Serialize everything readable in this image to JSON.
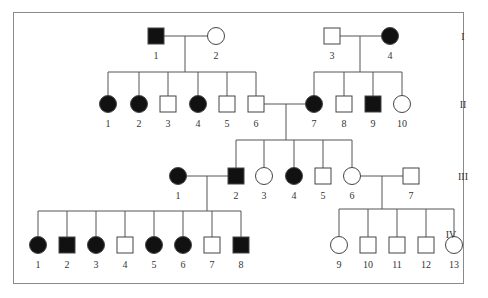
{
  "diagram": {
    "type": "pedigree",
    "generations": [
      {
        "label": "I",
        "y": 36
      },
      {
        "label": "II",
        "y": 104
      },
      {
        "label": "III",
        "y": 176
      },
      {
        "label": "IV",
        "y": 234
      }
    ],
    "colors": {
      "affected": "#111111",
      "unaffected": "#ffffff",
      "line": "#555555"
    },
    "individuals": [
      {
        "id": "I-1",
        "num": "1",
        "sex": "male",
        "affected": true,
        "x": 156,
        "y": 36
      },
      {
        "id": "I-2",
        "num": "2",
        "sex": "female",
        "affected": false,
        "x": 216,
        "y": 36
      },
      {
        "id": "I-3",
        "num": "3",
        "sex": "male",
        "affected": false,
        "x": 332,
        "y": 36
      },
      {
        "id": "I-4",
        "num": "4",
        "sex": "female",
        "affected": true,
        "x": 390,
        "y": 36
      },
      {
        "id": "II-1",
        "num": "1",
        "sex": "female",
        "affected": true,
        "x": 108,
        "y": 104
      },
      {
        "id": "II-2",
        "num": "2",
        "sex": "female",
        "affected": true,
        "x": 139,
        "y": 104
      },
      {
        "id": "II-3",
        "num": "3",
        "sex": "male",
        "affected": false,
        "x": 168,
        "y": 104
      },
      {
        "id": "II-4",
        "num": "4",
        "sex": "female",
        "affected": true,
        "x": 198,
        "y": 104
      },
      {
        "id": "II-5",
        "num": "5",
        "sex": "male",
        "affected": false,
        "x": 227,
        "y": 104
      },
      {
        "id": "II-6",
        "num": "6",
        "sex": "male",
        "affected": false,
        "x": 256,
        "y": 104
      },
      {
        "id": "II-7",
        "num": "7",
        "sex": "female",
        "affected": true,
        "x": 314,
        "y": 104
      },
      {
        "id": "II-8",
        "num": "8",
        "sex": "male",
        "affected": false,
        "x": 344,
        "y": 104
      },
      {
        "id": "II-9",
        "num": "9",
        "sex": "male",
        "affected": true,
        "x": 373,
        "y": 104
      },
      {
        "id": "II-10",
        "num": "10",
        "sex": "female",
        "affected": false,
        "x": 402,
        "y": 104
      },
      {
        "id": "III-1",
        "num": "1",
        "sex": "female",
        "affected": true,
        "x": 178,
        "y": 176
      },
      {
        "id": "III-2",
        "num": "2",
        "sex": "male",
        "affected": true,
        "x": 236,
        "y": 176
      },
      {
        "id": "III-3",
        "num": "3",
        "sex": "female",
        "affected": false,
        "x": 264,
        "y": 176
      },
      {
        "id": "III-4",
        "num": "4",
        "sex": "female",
        "affected": true,
        "x": 294,
        "y": 176
      },
      {
        "id": "III-5",
        "num": "5",
        "sex": "male",
        "affected": false,
        "x": 323,
        "y": 176
      },
      {
        "id": "III-6",
        "num": "6",
        "sex": "female",
        "affected": false,
        "x": 352,
        "y": 176
      },
      {
        "id": "III-7",
        "num": "7",
        "sex": "male",
        "affected": false,
        "x": 411,
        "y": 176
      },
      {
        "id": "IV-1",
        "num": "1",
        "sex": "female",
        "affected": true,
        "x": 38,
        "y": 245
      },
      {
        "id": "IV-2",
        "num": "2",
        "sex": "male",
        "affected": true,
        "x": 67,
        "y": 245
      },
      {
        "id": "IV-3",
        "num": "3",
        "sex": "female",
        "affected": true,
        "x": 96,
        "y": 245
      },
      {
        "id": "IV-4",
        "num": "4",
        "sex": "male",
        "affected": false,
        "x": 125,
        "y": 245
      },
      {
        "id": "IV-5",
        "num": "5",
        "sex": "female",
        "affected": true,
        "x": 154,
        "y": 245
      },
      {
        "id": "IV-6",
        "num": "6",
        "sex": "female",
        "affected": true,
        "x": 183,
        "y": 245
      },
      {
        "id": "IV-7",
        "num": "7",
        "sex": "male",
        "affected": false,
        "x": 212,
        "y": 245
      },
      {
        "id": "IV-8",
        "num": "8",
        "sex": "male",
        "affected": true,
        "x": 241,
        "y": 245
      },
      {
        "id": "IV-9",
        "num": "9",
        "sex": "female",
        "affected": false,
        "x": 339,
        "y": 245
      },
      {
        "id": "IV-10",
        "num": "10",
        "sex": "male",
        "affected": false,
        "x": 368,
        "y": 245
      },
      {
        "id": "IV-11",
        "num": "11",
        "sex": "male",
        "affected": false,
        "x": 397,
        "y": 245
      },
      {
        "id": "IV-12",
        "num": "12",
        "sex": "male",
        "affected": false,
        "x": 426,
        "y": 245
      },
      {
        "id": "IV-13",
        "num": "13",
        "sex": "female",
        "affected": false,
        "x": 454,
        "y": 245
      }
    ],
    "matings": [
      {
        "partners": [
          "I-1",
          "I-2"
        ],
        "y": 36,
        "drop_x": 185,
        "sibship_y": 72,
        "children": [
          "II-1",
          "II-2",
          "II-3",
          "II-4",
          "II-5",
          "II-6"
        ]
      },
      {
        "partners": [
          "I-3",
          "I-4"
        ],
        "y": 36,
        "drop_x": 360,
        "sibship_y": 72,
        "children": [
          "II-7",
          "II-8",
          "II-9",
          "II-10"
        ]
      },
      {
        "partners": [
          "II-6",
          "II-7"
        ],
        "y": 104,
        "drop_x": 286,
        "sibship_y": 140,
        "children": [
          "III-2",
          "III-3",
          "III-4",
          "III-5",
          "III-6"
        ]
      },
      {
        "partners": [
          "III-1",
          "III-2"
        ],
        "y": 176,
        "drop_x": 207,
        "sibship_y": 211,
        "children": [
          "IV-1",
          "IV-2",
          "IV-3",
          "IV-4",
          "IV-5",
          "IV-6",
          "IV-7",
          "IV-8"
        ]
      },
      {
        "partners": [
          "III-6",
          "III-7"
        ],
        "y": 176,
        "drop_x": 382,
        "sibship_y": 209,
        "children": [
          "IV-9",
          "IV-10",
          "IV-11",
          "IV-12",
          "IV-13"
        ]
      }
    ]
  }
}
